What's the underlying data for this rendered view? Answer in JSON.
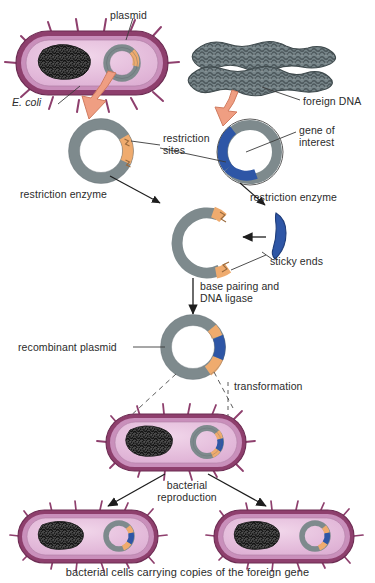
{
  "diagram": {
    "caption": "bacterial cells carrying copies of the foreign gene"
  },
  "colors": {
    "cell_wall_outer": "#8e3f6d",
    "cell_wall_mid": "#c98fbb",
    "cytoplasm": "#e3b9d8",
    "cytoplasm_inner": "#efd0e6",
    "chromosome_dna": "#2a2a2a",
    "plasmid_gray": "#7e8a8d",
    "plasmid_gray_dark": "#67737a",
    "restriction_site_orange": "#efab6e",
    "gene_blue": "#2e56a6",
    "gene_blue_dark": "#24428a",
    "foreign_dna_gray": "#6f7d80",
    "arrow_salmon": "#ef9e82",
    "arrow_salmon_edge": "#d07b5f",
    "leader_line": "#3a3a3a",
    "text": "#2b2b2b"
  },
  "labels": {
    "plasmid": "plasmid",
    "e_coli": "E. coli",
    "foreign_dna": "foreign DNA",
    "restriction_sites": "restriction\nsites",
    "gene_of_interest": "gene of\ninterest",
    "restriction_enzyme_left": "restriction enzyme",
    "restriction_enzyme_right": "restriction enzyme",
    "sticky_ends": "sticky ends",
    "base_pairing": "base pairing and\nDNA ligase",
    "recombinant_plasmid": "recombinant plasmid",
    "transformation": "transformation",
    "bacterial_reproduction": "bacterial\nreproduction",
    "bottom_caption": "bacterial cells carrying copies of the foreign gene"
  },
  "steps": [
    {
      "id": "step-1",
      "name": "e-coli-with-plasmid",
      "label": "E. coli cell containing a plasmid"
    },
    {
      "id": "step-2",
      "name": "foreign-dna-chromosomes",
      "label": "foreign DNA chromosomes"
    },
    {
      "id": "step-3",
      "name": "isolated-plasmid",
      "label": "isolated plasmid with restriction sites"
    },
    {
      "id": "step-4",
      "name": "foreign-dna-circle",
      "label": "foreign DNA with gene of interest"
    },
    {
      "id": "step-5",
      "name": "cut-plasmid",
      "label": "cut plasmid with sticky ends"
    },
    {
      "id": "step-6",
      "name": "cut-gene-fragment",
      "label": "excised gene fragment"
    },
    {
      "id": "step-7",
      "name": "recombinant-plasmid",
      "label": "recombinant plasmid"
    },
    {
      "id": "step-8",
      "name": "transformed-bacterium",
      "label": "transformed bacterium"
    },
    {
      "id": "step-9",
      "name": "daughter-cell-left",
      "label": "daughter cell left"
    },
    {
      "id": "step-10",
      "name": "daughter-cell-right",
      "label": "daughter cell right"
    }
  ]
}
